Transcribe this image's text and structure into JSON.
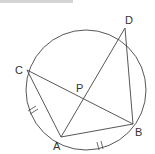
{
  "diagram": {
    "type": "circle-geometry",
    "circle": {
      "cx": 86,
      "cy": 90,
      "r": 60
    },
    "points": {
      "A": {
        "label": "A",
        "x": 61,
        "y": 137
      },
      "B": {
        "label": "B",
        "x": 133,
        "y": 124
      },
      "C": {
        "label": "C",
        "x": 27,
        "y": 70
      },
      "D": {
        "label": "D",
        "x": 125,
        "y": 28
      },
      "P": {
        "label": "P",
        "x": 82,
        "y": 98
      }
    },
    "segments": [
      "CA",
      "CB",
      "AD",
      "AB",
      "DB"
    ],
    "equal_arc_marks": [
      "arc CA",
      "arc AB"
    ],
    "colors": {
      "stroke": "#444444",
      "text": "#333333"
    }
  }
}
